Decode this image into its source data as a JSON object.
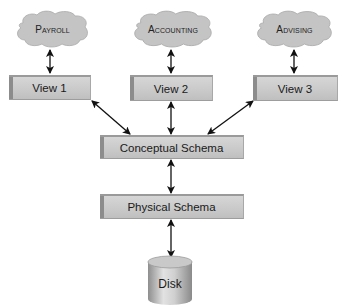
{
  "diagram": {
    "external_views": [
      {
        "cloud_label": "Payroll",
        "view_label": "View 1"
      },
      {
        "cloud_label": "Accounting",
        "view_label": "View 2"
      },
      {
        "cloud_label": "Advising",
        "view_label": "View 3"
      }
    ],
    "conceptual_schema": {
      "label": "Conceptual Schema"
    },
    "physical_schema": {
      "label": "Physical Schema"
    },
    "storage": {
      "label": "Disk"
    },
    "connections": [
      {
        "from": "Payroll",
        "to": "View 1",
        "type": "bidirectional"
      },
      {
        "from": "Accounting",
        "to": "View 2",
        "type": "bidirectional"
      },
      {
        "from": "Advising",
        "to": "View 3",
        "type": "bidirectional"
      },
      {
        "from": "View 1",
        "to": "Conceptual Schema",
        "type": "bidirectional"
      },
      {
        "from": "View 2",
        "to": "Conceptual Schema",
        "type": "bidirectional"
      },
      {
        "from": "View 3",
        "to": "Conceptual Schema",
        "type": "bidirectional"
      },
      {
        "from": "Conceptual Schema",
        "to": "Physical Schema",
        "type": "bidirectional"
      },
      {
        "from": "Physical Schema",
        "to": "Disk",
        "type": "bidirectional"
      }
    ],
    "colors": {
      "box_fill": "#c9c9c9",
      "box_edge": "#8c8c8c",
      "cloud_fill": "#c4c4c4",
      "arrow": "#111111",
      "text": "#1a1a1a"
    }
  }
}
